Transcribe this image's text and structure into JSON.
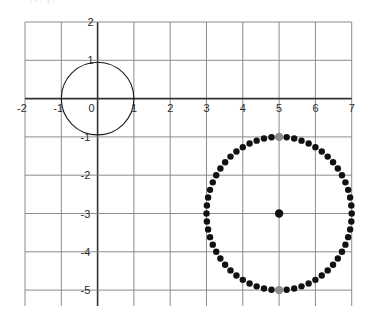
{
  "caption": {
    "clipped_text": "(x, y)"
  },
  "chart_data": {
    "type": "scatter",
    "title": "",
    "subtitle": "",
    "xlabel": "",
    "ylabel": "",
    "xlim": [
      -2,
      7
    ],
    "ylim": [
      -5,
      2
    ],
    "grid": true,
    "grid_step": 1,
    "legend": "none",
    "axis_labels": {
      "x_ticks": [
        "-2",
        "-1",
        "0",
        "1",
        "2",
        "3",
        "4",
        "5",
        "6",
        "7"
      ],
      "x_tick_values": [
        -2,
        -1,
        0,
        1,
        2,
        3,
        4,
        5,
        6,
        7
      ],
      "y_ticks": [
        "2",
        "1",
        "0",
        "-1",
        "-2",
        "-3",
        "-4",
        "-5"
      ],
      "y_tick_values": [
        2,
        1,
        0,
        -1,
        -2,
        -3,
        -4,
        -5
      ],
      "origin_label": "0"
    },
    "colors": {
      "grid_line": "#808080",
      "axis_line": "#333333",
      "curve_stroke": "#1a1a1a",
      "dot_fill": "#111111",
      "highlight_dot_fill": "#8c8c8c",
      "tick_label": "#2b2b2b",
      "background": "#ffffff"
    },
    "series": [
      {
        "name": "unit-circle",
        "type": "circle-outline",
        "center": [
          0,
          0
        ],
        "radius": 1,
        "stroke_width": 1.1,
        "color": "#1a1a1a"
      },
      {
        "name": "dotted-circle",
        "type": "circle-dots",
        "center": [
          5,
          -3
        ],
        "radius": 2,
        "dot_count": 60,
        "dot_radius_px": 3.2,
        "color": "#111111",
        "start_angle_deg": 90
      },
      {
        "name": "center-point",
        "type": "point",
        "point": [
          5,
          -3
        ],
        "dot_radius_px": 4.2,
        "color": "#111111"
      },
      {
        "name": "highlight-top",
        "type": "point",
        "point": [
          5,
          -1
        ],
        "dot_radius_px": 4.2,
        "color": "#8c8c8c"
      },
      {
        "name": "highlight-bottom",
        "type": "point",
        "point": [
          5,
          -5
        ],
        "dot_radius_px": 4.2,
        "color": "#8c8c8c"
      }
    ],
    "annotations": []
  }
}
